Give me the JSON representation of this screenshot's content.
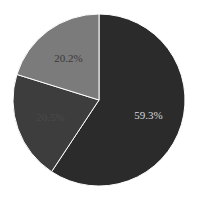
{
  "chart_data": {
    "type": "pie",
    "title": "",
    "categories": [
      "Slice A",
      "Slice B",
      "Slice C"
    ],
    "values": [
      59.3,
      20.5,
      20.2
    ],
    "labels": [
      "59.3%",
      "20.5%",
      "20.2%"
    ],
    "colors": [
      "#2b2b2b",
      "#3d3d3d",
      "#7b7b7b"
    ],
    "label_colors": [
      "#d8d8d8",
      "#4a4a4a",
      "#3a3a3a"
    ],
    "start_angle": 90,
    "direction": "clockwise",
    "edge_color": "#ffffff",
    "legend": "none"
  }
}
